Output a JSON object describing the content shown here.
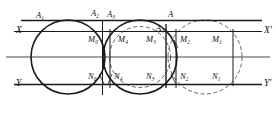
{
  "figure": {
    "kind": "geometric-construction-diagram",
    "background_color": "#ffffff",
    "stroke_color": "#1a1a1a",
    "dashed_color": "#555555",
    "width": 276,
    "height": 116,
    "axes": [
      {
        "id": "top-rule",
        "name": "top-horizontal-rule",
        "y": 20.5,
        "x1": 21,
        "x2": 262,
        "style": "solid",
        "weight": 1.3
      },
      {
        "id": "x-axis",
        "name": "x-axis",
        "y": 31.5,
        "x1": 14,
        "x2": 262,
        "style": "solid",
        "weight": 1.1
      },
      {
        "id": "mid-rule",
        "name": "middle-center-line",
        "y": 57.0,
        "x1": 6,
        "x2": 270,
        "style": "solid",
        "weight": 0.8
      },
      {
        "id": "y-axis",
        "name": "y-axis",
        "y": 84.5,
        "x1": 14,
        "x2": 262,
        "style": "solid",
        "weight": 1.3
      }
    ],
    "verticals": [
      {
        "id": "v-M0N0",
        "x": 102.5,
        "y1": 20.5,
        "y2": 95.0,
        "style": "solid",
        "weight": 1.0
      },
      {
        "id": "v-M4N4",
        "x": 110.0,
        "y1": 29.0,
        "y2": 88.0,
        "style": "solid",
        "weight": 1.0
      },
      {
        "id": "v-A4",
        "x": 166.0,
        "y1": 24.0,
        "y2": 88.0,
        "style": "solid",
        "weight": 1.4
      },
      {
        "id": "v-M2N2",
        "x": 176.0,
        "y1": 29.0,
        "y2": 88.0,
        "style": "solid",
        "weight": 1.0
      },
      {
        "id": "v-M1N1",
        "x": 233.0,
        "y1": 29.0,
        "y2": 86.0,
        "style": "solid",
        "weight": 1.0
      }
    ],
    "circles": [
      {
        "id": "c1",
        "name": "solid-circle-left",
        "cx": 68.0,
        "cy": 57.0,
        "r": 37.0,
        "style": "solid",
        "weight": 1.6
      },
      {
        "id": "c2",
        "name": "solid-circle-middle",
        "cx": 140.0,
        "cy": 57.0,
        "r": 37.0,
        "style": "solid",
        "weight": 1.6
      },
      {
        "id": "c3",
        "name": "dashed-circle-left",
        "cx": 140.0,
        "cy": 57.0,
        "r": 30.5,
        "style": "dashed",
        "weight": 0.9
      },
      {
        "id": "c4",
        "name": "dashed-circle-right",
        "cx": 205.0,
        "cy": 57.0,
        "r": 37.0,
        "style": "dashed",
        "weight": 0.9
      }
    ],
    "axis_labels": [
      {
        "id": "X",
        "name": "axis-label-x",
        "text": "X",
        "sup": "",
        "x": 16,
        "y": 26,
        "class": "lbl-axis"
      },
      {
        "id": "Xprime",
        "name": "axis-label-x-prime",
        "text": "X",
        "sup": "'",
        "x": 264,
        "y": 26,
        "class": "lbl-axis"
      },
      {
        "id": "Y",
        "name": "axis-label-y",
        "text": "Y",
        "sup": "",
        "x": 16,
        "y": 79,
        "class": "lbl-axis"
      },
      {
        "id": "Yprime",
        "name": "axis-label-y-prime",
        "text": "Y",
        "sup": "'",
        "x": 264,
        "y": 79,
        "class": "lbl-axis"
      }
    ],
    "point_labels": [
      {
        "id": "A1",
        "name": "point-label-a1",
        "base": "A",
        "sub": "1",
        "x": 36,
        "y": 11,
        "class": "lbl-a"
      },
      {
        "id": "A2",
        "name": "point-label-a2",
        "base": "A",
        "sub": "2",
        "x": 91,
        "y": 9,
        "class": "lbl-a"
      },
      {
        "id": "A3",
        "name": "point-label-a3",
        "base": "A",
        "sub": "3",
        "x": 107,
        "y": 10,
        "class": "lbl-a"
      },
      {
        "id": "A",
        "name": "point-label-a",
        "base": "A",
        "sub": "",
        "x": 168,
        "y": 10,
        "class": "lbl-a"
      },
      {
        "id": "A4",
        "name": "point-label-a4",
        "base": "A",
        "sub": "4",
        "x": 156,
        "y": 24,
        "class": "lbl-a"
      },
      {
        "id": "M0",
        "name": "point-label-m0",
        "base": "M",
        "sub": "0",
        "x": 88,
        "y": 35,
        "class": "lbl-pt"
      },
      {
        "id": "M4",
        "name": "point-label-m4",
        "base": "M",
        "sub": "4",
        "x": 118,
        "y": 35,
        "class": "lbl-pt"
      },
      {
        "id": "M3",
        "name": "point-label-m3",
        "base": "M",
        "sub": "3",
        "x": 146,
        "y": 35,
        "class": "lbl-pt"
      },
      {
        "id": "M2",
        "name": "point-label-m2",
        "base": "M",
        "sub": "2",
        "x": 180,
        "y": 35,
        "class": "lbl-pt"
      },
      {
        "id": "M1",
        "name": "point-label-m1",
        "base": "M",
        "sub": "1",
        "x": 212,
        "y": 35,
        "class": "lbl-pt"
      },
      {
        "id": "N0",
        "name": "point-label-n0",
        "base": "N",
        "sub": "0",
        "x": 88,
        "y": 72,
        "class": "lbl-pt"
      },
      {
        "id": "N4",
        "name": "point-label-n4",
        "base": "N",
        "sub": "4",
        "x": 114,
        "y": 72,
        "class": "lbl-pt"
      },
      {
        "id": "N3",
        "name": "point-label-n3",
        "base": "N",
        "sub": "3",
        "x": 146,
        "y": 72,
        "class": "lbl-pt"
      },
      {
        "id": "N2",
        "name": "point-label-n2",
        "base": "N",
        "sub": "2",
        "x": 180,
        "y": 72,
        "class": "lbl-pt"
      },
      {
        "id": "N1",
        "name": "point-label-n1",
        "base": "N",
        "sub": "1",
        "x": 212,
        "y": 72,
        "class": "lbl-pt"
      }
    ],
    "tick_marks": [
      {
        "id": "t-M0",
        "name": "tick-m0",
        "x1": 101,
        "y1": 40,
        "x2": 104,
        "y2": 52
      },
      {
        "id": "t-N0",
        "name": "tick-n0",
        "x1": 99,
        "y1": 74,
        "x2": 104,
        "y2": 84
      },
      {
        "id": "t-N4",
        "name": "tick-n4",
        "x1": 112,
        "y1": 74,
        "x2": 108,
        "y2": 84
      },
      {
        "id": "t-M2",
        "name": "tick-m2",
        "x1": 174,
        "y1": 40,
        "x2": 178,
        "y2": 48
      },
      {
        "id": "t-N2",
        "name": "tick-n2",
        "x1": 171,
        "y1": 74,
        "x2": 176,
        "y2": 84
      }
    ]
  }
}
